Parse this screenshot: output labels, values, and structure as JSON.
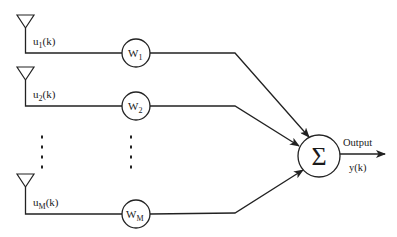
{
  "diagram": {
    "title": "",
    "inputs": [
      {
        "id": "u1",
        "label_main": "u",
        "label_sub": "1",
        "label_suffix": "(k)",
        "weight_main": "W",
        "weight_sub": "1",
        "y": 53,
        "ant_top": 15
      },
      {
        "id": "u2",
        "label_main": "u",
        "label_sub": "2",
        "label_suffix": "(k)",
        "weight_main": "W",
        "weight_sub": "2",
        "y": 106,
        "ant_top": 67
      },
      {
        "id": "uM",
        "label_main": "u",
        "label_sub": "M",
        "label_suffix": "(k)",
        "weight_main": "W",
        "weight_sub": "M",
        "y": 214,
        "ant_top": 174
      }
    ],
    "ellipsis": {
      "columns_x": [
        42,
        131
      ],
      "dots_y": [
        137,
        147,
        157,
        167
      ]
    },
    "summer": {
      "symbol": "Σ",
      "cx": 319,
      "cy": 156,
      "r": 21
    },
    "output": {
      "label": "Output",
      "signal": "y(k)"
    },
    "weight_node": {
      "cx": 136,
      "r": 14
    },
    "bend_x": 235,
    "arrow_tips": [
      {
        "x": 309,
        "y": 137
      },
      {
        "x": 299,
        "y": 146
      },
      {
        "x": 303,
        "y": 170
      }
    ],
    "colors": {
      "stroke": "#222222",
      "text": "#1a1a1a",
      "background": "#ffffff"
    }
  }
}
